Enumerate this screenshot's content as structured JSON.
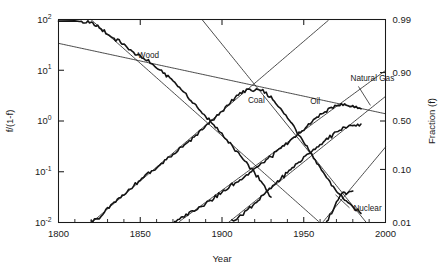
{
  "chart_data": {
    "type": "line",
    "title": "",
    "subtitle": "",
    "xlabel": "Year",
    "ylabel": "f/(1-f)",
    "y2label": "Fraction (f)",
    "xlim": [
      1800,
      2000
    ],
    "ylim_log": [
      -2,
      2
    ],
    "xticks": [
      1800,
      1850,
      1900,
      1950,
      2000
    ],
    "xtick_labels": [
      "1800",
      "1850",
      "1900",
      "1950",
      "2000"
    ],
    "xminor_step": 10,
    "yticks_log": [
      2,
      1,
      0,
      -1,
      -2
    ],
    "ytick_labels": [
      "10",
      "10",
      "10",
      "10",
      "10"
    ],
    "ytick_exponents": [
      "2",
      "1",
      "0",
      "-1",
      "-2"
    ],
    "y2ticks_log": [
      2,
      0.9542,
      0,
      -0.9542,
      -2
    ],
    "y2tick_labels": [
      "0.99",
      "0.90",
      "0.50",
      "0.10",
      "0.01"
    ],
    "grid": false,
    "legend": "inline-annotations",
    "scale": "logit / log odds",
    "annotations": [
      {
        "label": "Wood",
        "x": 1855,
        "y_log": 1.24
      },
      {
        "label": "Coal",
        "x": 1921,
        "y_log": 0.36
      },
      {
        "label": "Oil",
        "x": 1957,
        "y_log": 0.34
      },
      {
        "label": "Natural Gas",
        "x": 1992,
        "y_log": 0.78
      },
      {
        "label": "Nuclear",
        "x": 1989,
        "y_log": -1.77
      }
    ],
    "series": [
      {
        "name": "Wood",
        "kind": "logistic-substitution",
        "fit": {
          "midpoint_year": 1880,
          "slope_decades_per_decade": -0.0462,
          "y_log_at_1800": 3.7
        },
        "x": [
          1800,
          1805,
          1810,
          1815,
          1820,
          1825,
          1830,
          1835,
          1840,
          1845,
          1850,
          1855,
          1860,
          1865,
          1870,
          1875,
          1880,
          1885,
          1890,
          1895,
          1900,
          1905,
          1910,
          1915,
          1920,
          1925,
          1930
        ],
        "y_log": [
          2.0,
          2.03,
          2.01,
          1.95,
          1.93,
          1.83,
          1.72,
          1.61,
          1.5,
          1.37,
          1.28,
          1.18,
          1.05,
          0.92,
          0.8,
          0.62,
          0.44,
          0.26,
          0.1,
          -0.08,
          -0.26,
          -0.45,
          -0.64,
          -0.83,
          -1.02,
          -1.25,
          -1.5
        ]
      },
      {
        "name": "Coal",
        "kind": "logistic-substitution",
        "fit": {
          "peak_year": 1915,
          "peak_y_log": 0.62,
          "rise_midpoint_year": 1895,
          "fall_midpoint_year": 1935
        },
        "x": [
          1818,
          1825,
          1830,
          1840,
          1850,
          1860,
          1870,
          1880,
          1890,
          1900,
          1910,
          1915,
          1920,
          1925,
          1930,
          1935,
          1940,
          1945,
          1950,
          1955,
          1960,
          1965,
          1970,
          1975,
          1980,
          1985
        ],
        "y_log": [
          -2.0,
          -1.92,
          -1.74,
          -1.44,
          -1.16,
          -0.92,
          -0.66,
          -0.4,
          -0.12,
          0.2,
          0.52,
          0.62,
          0.6,
          0.58,
          0.46,
          0.28,
          0.06,
          -0.16,
          -0.4,
          -0.66,
          -0.92,
          -1.16,
          -1.38,
          -1.56,
          -1.7,
          -1.82
        ]
      },
      {
        "name": "Oil",
        "kind": "logistic-substitution",
        "fit": {
          "peak_year": 1972,
          "peak_y_log": 0.33,
          "rise_midpoint_year": 1952
        },
        "x": [
          1870,
          1875,
          1880,
          1885,
          1890,
          1895,
          1900,
          1910,
          1920,
          1930,
          1940,
          1950,
          1960,
          1970,
          1972,
          1975,
          1980,
          1985
        ],
        "y_log": [
          -2.0,
          -1.93,
          -1.8,
          -1.72,
          -1.62,
          -1.52,
          -1.4,
          -1.18,
          -0.94,
          -0.7,
          -0.44,
          -0.16,
          0.12,
          0.31,
          0.33,
          0.32,
          0.29,
          0.24
        ]
      },
      {
        "name": "Natural Gas",
        "kind": "logistic-substitution",
        "fit": {
          "midpoint_year": 2007,
          "y_log_at_1900": -2.6
        },
        "x": [
          1905,
          1910,
          1920,
          1930,
          1940,
          1950,
          1960,
          1970,
          1975,
          1980,
          1985
        ],
        "y_log": [
          -2.0,
          -1.9,
          -1.62,
          -1.32,
          -1.02,
          -0.72,
          -0.46,
          -0.22,
          -0.14,
          -0.08,
          -0.06
        ]
      },
      {
        "name": "Nuclear",
        "kind": "logistic-substitution",
        "fit": {
          "midpoint_year": 2025
        },
        "x": [
          1963,
          1965,
          1968,
          1970,
          1972,
          1974,
          1976,
          1978,
          1980
        ],
        "y_log": [
          -2.0,
          -1.92,
          -1.74,
          -1.62,
          -1.5,
          -1.42,
          -1.44,
          -1.4,
          -1.38
        ]
      }
    ]
  },
  "axes": {
    "x_title": "Year",
    "y_title_parts": {
      "num": "f",
      "den": "(1-f)"
    },
    "y_title_plain": "f/(1-f)",
    "y2_title": "Fraction (f)"
  }
}
